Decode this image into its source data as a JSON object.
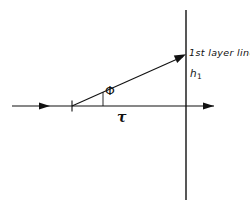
{
  "figure": {
    "background_color": "#ffffff",
    "stroke_color": "#111111",
    "width": 250,
    "height": 207,
    "labels": {
      "layer_line": "1st layer line",
      "h_symbol": "h",
      "h_subscript": "1",
      "angle": "Φ",
      "tau": "τ"
    },
    "elements": {
      "horizontal_axis_name": "horizontal-axis",
      "vertical_line_name": "vertical-layer-line",
      "ray_name": "diffracted-ray",
      "origin_tick_name": "origin-tick",
      "angle_leg_name": "angle-vertical-leg"
    },
    "geometry": {
      "origin_x": 72,
      "origin_y": 106,
      "axis_start_x": 12,
      "axis_end_x": 214,
      "axis_arrow_mid_x": 48,
      "vertical_line_x": 186,
      "vertical_top_y": 10,
      "vertical_bottom_y": 200,
      "ray_end_x": 186,
      "ray_end_y": 55,
      "angle_leg_x": 103,
      "angle_leg_top_y": 88
    }
  }
}
